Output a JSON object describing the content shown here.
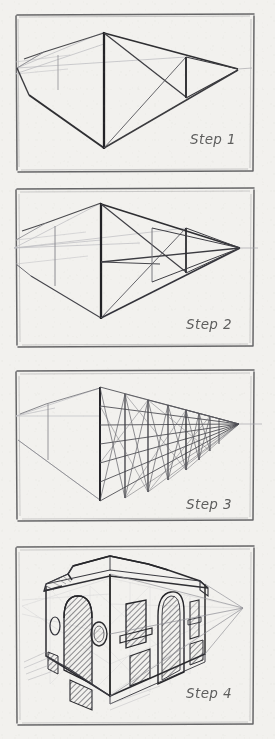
{
  "document": {
    "title": "Two-Point Perspective Drawing — Step Sequence",
    "medium": "pencil sketch on paper",
    "paper_color": "#f2f1ee",
    "graphite_color": "#2b2b2b",
    "panel_count": 4,
    "layout": "single vertical column of four bordered panels"
  },
  "panels": [
    {
      "index": 1,
      "label": "Step 1",
      "caption_position": "lower-right",
      "subject": "Basic two-point perspective box: front vertical edge with convergence lines to left and right vanishing points",
      "frame": {
        "x": 16,
        "y": 14,
        "width": 239,
        "height": 158
      },
      "horizon_visible": false,
      "vanishing_points": [
        {
          "name": "left-vanishing-point",
          "x": 17,
          "y": 68,
          "on_panel": false
        },
        {
          "name": "right-vanishing-point",
          "x": 238,
          "y": 69,
          "on_panel": true
        }
      ],
      "key_vertices": {
        "front_corner_top": {
          "x": 104,
          "y": 32
        },
        "front_corner_bottom": {
          "x": 104,
          "y": 148
        },
        "right_edge_top": {
          "x": 186,
          "y": 57
        },
        "right_edge_bottom": {
          "x": 186,
          "y": 97
        },
        "left_edge_top": {
          "x": 44,
          "y": 52
        },
        "left_edge_bottom": {
          "x": 30,
          "y": 95
        }
      }
    },
    {
      "index": 2,
      "label": "Step 2",
      "caption_position": "lower-right",
      "subject": "Horizon line drawn through both vanishing points; additional receding guide lines added to locate the far wall",
      "frame": {
        "x": 16,
        "y": 188,
        "width": 239,
        "height": 160
      },
      "horizon_visible": true,
      "horizon_y": 248,
      "vanishing_points": [
        {
          "name": "left-vanishing-point",
          "x": 14,
          "y": 248,
          "on_panel": false
        },
        {
          "name": "right-vanishing-point",
          "x": 240,
          "y": 248,
          "on_panel": true
        }
      ],
      "key_vertices": {
        "front_corner_top": {
          "x": 101,
          "y": 203
        },
        "front_corner_bottom": {
          "x": 101,
          "y": 318
        },
        "right_edge_top": {
          "x": 186,
          "y": 228
        },
        "right_edge_bottom": {
          "x": 186,
          "y": 272
        }
      }
    },
    {
      "index": 3,
      "label": "Step 3",
      "caption_position": "lower-right",
      "subject": "Dense perspective grid: vertical divisions plus converging horizontals and diagonals subdividing the two wall planes",
      "frame": {
        "x": 16,
        "y": 370,
        "width": 239,
        "height": 152
      },
      "horizon_visible": true,
      "horizon_y": 424,
      "vanishing_points": [
        {
          "name": "left-vanishing-point",
          "x": 14,
          "y": 424,
          "on_panel": false
        },
        {
          "name": "right-vanishing-point",
          "x": 239,
          "y": 424,
          "on_panel": true
        }
      ],
      "grid": {
        "vertical_divisions": 7,
        "horizontal_divisions": 6,
        "diagonals": true
      }
    },
    {
      "index": 4,
      "label": "Step 4",
      "caption_position": "lower-right",
      "subject": "Finished building rendered over the grid: gabled roof, tall arched doorways and windows with diagonal hatching, round oculus windows, and a projecting sill",
      "frame": {
        "x": 16,
        "y": 546,
        "width": 239,
        "height": 179
      },
      "horizon_visible": true,
      "horizon_y": 608,
      "vanishing_points": [
        {
          "name": "right-vanishing-point",
          "x": 243,
          "y": 608,
          "on_panel": true
        }
      ],
      "features": [
        "gabled roof with ridge",
        "arched doorway (left wall, hatched)",
        "arched doorway (right wall, hatched)",
        "round oculus window",
        "oval window",
        "rectangular window with sill",
        "hatched shadow panels at base",
        "construction grid still visible"
      ]
    }
  ],
  "colors": {
    "paper": "#f2f1ee",
    "graphite_dark": "#2b2b2b",
    "graphite_mid": "#55555a",
    "graphite_light": "#9a9a9e",
    "construction_line": "#b7b7bb",
    "label_text": "#4a4a4a"
  }
}
